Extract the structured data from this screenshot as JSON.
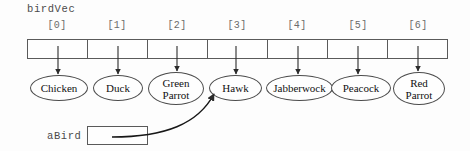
{
  "diagram": {
    "vector_name": "birdVec",
    "pointer_name": "aBird",
    "pointer_value": "",
    "pointer_target_index": 3,
    "indices": [
      "[0]",
      "[1]",
      "[2]",
      "[3]",
      "[4]",
      "[5]",
      "[6]"
    ],
    "elements": [
      {
        "index": "[0]",
        "label": "Chicken",
        "lines": [
          "Chicken"
        ]
      },
      {
        "index": "[1]",
        "label": "Duck",
        "lines": [
          "Duck"
        ]
      },
      {
        "index": "[2]",
        "label": "Green Parrot",
        "lines": [
          "Green",
          "Parrot"
        ]
      },
      {
        "index": "[3]",
        "label": "Hawk",
        "lines": [
          "Hawk"
        ]
      },
      {
        "index": "[4]",
        "label": "Jabberwock",
        "lines": [
          "Jabberwock"
        ]
      },
      {
        "index": "[5]",
        "label": "Peacock",
        "lines": [
          "Peacock"
        ]
      },
      {
        "index": "[6]",
        "label": "Red Parrot",
        "lines": [
          "Red",
          "Parrot"
        ]
      }
    ],
    "colors": {
      "background": "#fdfdfd",
      "stroke": "#4c4c4c",
      "index_text": "#6b6b6b",
      "mono_text": "#4a4a4a",
      "node_text": "#111111"
    }
  }
}
